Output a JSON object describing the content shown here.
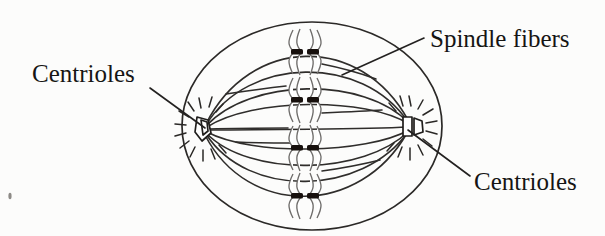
{
  "document": {
    "title": "Cell division diagram — metaphase spindle",
    "background_color": "#fcfcfb",
    "ink_color": "#201e1c",
    "width": 605,
    "height": 236
  },
  "labels": {
    "spindle_fibers": "Spindle fibers",
    "centrioles_left": "Centrioles",
    "centrioles_right": "Centrioles"
  },
  "diagram": {
    "cell": {
      "name": "cell-membrane",
      "shape": "ellipse",
      "cx": 312,
      "cy": 126,
      "rx": 130,
      "ry": 104
    },
    "poles": [
      {
        "name": "left-centriole",
        "x": 202,
        "y": 128
      },
      {
        "name": "right-centriole",
        "x": 412,
        "y": 126
      }
    ],
    "chromosomes": [
      {
        "name": "chromosome-1",
        "x": 305,
        "y": 52
      },
      {
        "name": "chromosome-2",
        "x": 305,
        "y": 100
      },
      {
        "name": "chromosome-3",
        "x": 305,
        "y": 148
      },
      {
        "name": "chromosome-4",
        "x": 305,
        "y": 196
      }
    ],
    "spindle_fiber_count": 9,
    "aster_ray_count": 12
  },
  "leaders": {
    "spindle_fibers": {
      "from_x": 424,
      "from_y": 38,
      "to_x": 342,
      "to_y": 75
    },
    "centrioles_left": {
      "from_x": 150,
      "from_y": 88,
      "to_x": 205,
      "to_y": 128
    },
    "centrioles_right": {
      "from_x": 470,
      "from_y": 176,
      "to_x": 408,
      "to_y": 130
    }
  }
}
